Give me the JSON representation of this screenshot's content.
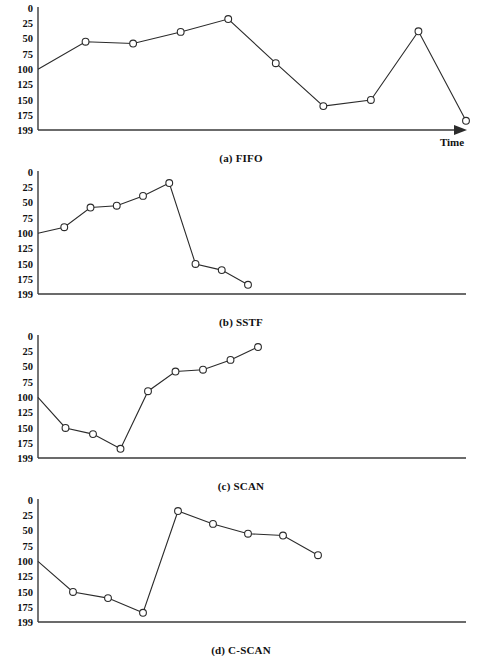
{
  "figure": {
    "axis": {
      "y_ticks": [
        "0",
        "25",
        "50",
        "75",
        "100",
        "125",
        "150",
        "175",
        "199"
      ],
      "y_min": 0,
      "y_max": 199,
      "x_axis_label": "Time",
      "x_axis_arrow": true
    },
    "geometry": {
      "plot_left": 38,
      "plot_right": 466,
      "panel_height": 155,
      "plot_top_pad": 8,
      "plot_bottom_pad": 22,
      "marker_radius": 3.4
    }
  },
  "chart_data": [
    {
      "type": "line",
      "title": "(a) FIFO",
      "xlabel": "Time",
      "ylabel": "",
      "ylim": [
        0,
        199
      ],
      "y_inverted": true,
      "yticks": [
        0,
        25,
        50,
        75,
        100,
        125,
        150,
        175,
        199
      ],
      "grid": false,
      "legend": "none",
      "series": [
        {
          "name": "head position",
          "values": [
            100,
            55,
            58,
            39,
            18,
            90,
            160,
            150,
            38,
            184
          ],
          "x": [
            0,
            1,
            2,
            3,
            4,
            5,
            6,
            7,
            8,
            9
          ]
        }
      ],
      "x_span": [
        38,
        466
      ],
      "show_start_marker": false,
      "show_time_arrow": true
    },
    {
      "type": "line",
      "title": "(b) SSTF",
      "xlabel": "",
      "ylabel": "",
      "ylim": [
        0,
        199
      ],
      "y_inverted": true,
      "yticks": [
        0,
        25,
        50,
        75,
        100,
        125,
        150,
        175,
        199
      ],
      "grid": false,
      "legend": "none",
      "series": [
        {
          "name": "head position",
          "values": [
            100,
            90,
            58,
            55,
            39,
            18,
            150,
            160,
            184
          ],
          "x": [
            0,
            1,
            2,
            3,
            4,
            5,
            6,
            7,
            8
          ]
        }
      ],
      "x_span": [
        38,
        248
      ],
      "show_start_marker": false,
      "show_time_arrow": false
    },
    {
      "type": "line",
      "title": "(c) SCAN",
      "xlabel": "",
      "ylabel": "",
      "ylim": [
        0,
        199
      ],
      "y_inverted": true,
      "yticks": [
        0,
        25,
        50,
        75,
        100,
        125,
        150,
        175,
        199
      ],
      "grid": false,
      "legend": "none",
      "series": [
        {
          "name": "head position",
          "values": [
            100,
            150,
            160,
            184,
            90,
            58,
            55,
            39,
            18
          ],
          "x": [
            0,
            1,
            2,
            3,
            4,
            5,
            6,
            7,
            8
          ]
        }
      ],
      "x_span": [
        38,
        258
      ],
      "show_start_marker": false,
      "show_time_arrow": false
    },
    {
      "type": "line",
      "title": "(d) C-SCAN",
      "xlabel": "",
      "ylabel": "",
      "ylim": [
        0,
        199
      ],
      "y_inverted": true,
      "yticks": [
        0,
        25,
        50,
        75,
        100,
        125,
        150,
        175,
        199
      ],
      "grid": false,
      "legend": "none",
      "series": [
        {
          "name": "head position",
          "values": [
            100,
            150,
            160,
            184,
            18,
            39,
            55,
            58,
            90
          ],
          "x": [
            0,
            1,
            2,
            3,
            4,
            5,
            6,
            7,
            8
          ]
        }
      ],
      "x_span": [
        38,
        318
      ],
      "show_start_marker": false,
      "show_time_arrow": false
    }
  ]
}
